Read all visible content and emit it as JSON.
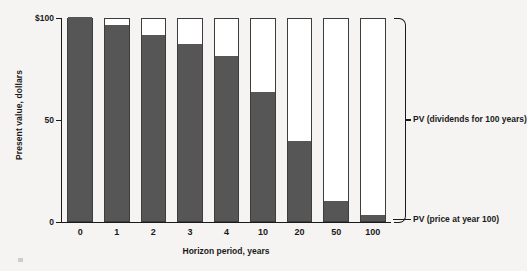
{
  "chart_data": {
    "type": "bar",
    "title": "",
    "xlabel": "Horizon period, years",
    "ylabel": "Present value, dollars",
    "categories": [
      "0",
      "1",
      "2",
      "3",
      "4",
      "10",
      "20",
      "50",
      "100"
    ],
    "ylim": [
      0,
      100
    ],
    "yticks": [
      {
        "value": 100,
        "label": "$100"
      },
      {
        "value": 50,
        "label": "50"
      },
      {
        "value": 0,
        "label": "0"
      }
    ],
    "grid": false,
    "stacked": true,
    "total_value": 100,
    "series": [
      {
        "name": "PV (dividends for 100 years)",
        "color": "#565656",
        "values": [
          100,
          96,
          91,
          87,
          81,
          63,
          39,
          10,
          3
        ]
      },
      {
        "name": "PV (price at year 100)",
        "color": "#ffffff",
        "values": [
          0,
          4,
          9,
          13,
          19,
          37,
          61,
          90,
          97
        ]
      }
    ],
    "legend": {
      "position": "right",
      "entries": [
        {
          "label": "PV (dividends for 100 years)",
          "marker": "brace"
        },
        {
          "label": "PV (price at year 100)",
          "marker": "leader-line"
        }
      ]
    },
    "colors": {
      "background": "#f5f4f2",
      "bar_fill": "#565656",
      "bar_empty": "#ffffff",
      "bar_outline": "#3d3d3d",
      "axis": "#1a1a1a",
      "text": "#1a1a1a"
    }
  }
}
